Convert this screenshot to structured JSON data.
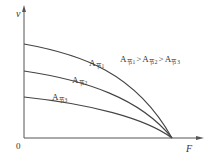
{
  "diagram": {
    "type": "line",
    "axes": {
      "y_label": "v",
      "x_label": "F",
      "origin_label": "0"
    },
    "curves": [
      {
        "name": "A节1",
        "base": "A",
        "sub": "节1",
        "start_v": "high"
      },
      {
        "name": "A节2",
        "base": "A",
        "sub": "节2",
        "start_v": "medium"
      },
      {
        "name": "A节3",
        "base": "A",
        "sub": "节3",
        "start_v": "low"
      }
    ],
    "relation": {
      "terms": [
        {
          "base": "A",
          "sub": "节1"
        },
        {
          "base": "A",
          "sub": "节2"
        },
        {
          "base": "A",
          "sub": "节3"
        }
      ],
      "operator": ">"
    },
    "note": "All three curves converge to v=0 at the same load F"
  }
}
